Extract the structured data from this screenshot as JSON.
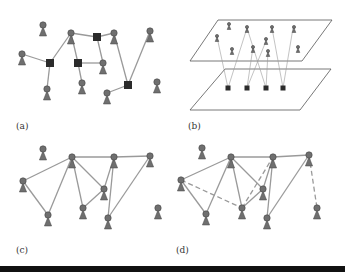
{
  "figure": {
    "colors": {
      "person_fill": "#6f6f6f",
      "person_stroke": "#444444",
      "square_fill": "#2b2b2b",
      "edge": "#9a9a9a",
      "plane": "#555555",
      "bar": "#111111"
    },
    "panels": [
      {
        "id": "a",
        "label": "(a)",
        "label_pos": [
          16,
          131
        ],
        "persons": [
          [
            43,
            25
          ],
          [
            71,
            33
          ],
          [
            114,
            33
          ],
          [
            150,
            31
          ],
          [
            22,
            54
          ],
          [
            103,
            63
          ],
          [
            47,
            89
          ],
          [
            82,
            83
          ],
          [
            107,
            93
          ],
          [
            157,
            82
          ]
        ],
        "squares": [
          [
            50,
            63
          ],
          [
            78,
            63
          ],
          [
            97,
            37
          ],
          [
            128,
            85
          ]
        ],
        "edges": [
          [
            [
              22,
              54
            ],
            [
              50,
              63
            ]
          ],
          [
            [
              50,
              63
            ],
            [
              47,
              89
            ]
          ],
          [
            [
              50,
              63
            ],
            [
              71,
              33
            ]
          ],
          [
            [
              71,
              33
            ],
            [
              97,
              37
            ]
          ],
          [
            [
              71,
              33
            ],
            [
              78,
              63
            ]
          ],
          [
            [
              78,
              63
            ],
            [
              103,
              63
            ]
          ],
          [
            [
              78,
              63
            ],
            [
              82,
              83
            ]
          ],
          [
            [
              97,
              37
            ],
            [
              114,
              33
            ]
          ],
          [
            [
              97,
              37
            ],
            [
              103,
              63
            ]
          ],
          [
            [
              114,
              33
            ],
            [
              128,
              85
            ]
          ],
          [
            [
              128,
              85
            ],
            [
              107,
              93
            ]
          ],
          [
            [
              128,
              85
            ],
            [
              150,
              31
            ]
          ]
        ],
        "dashed_edges": []
      },
      {
        "id": "b",
        "label": "(b)",
        "label_pos": [
          188,
          131
        ],
        "planes": [
          [
            [
              218,
              20
            ],
            [
              332,
              20
            ],
            [
              302,
              61
            ],
            [
              190,
              61
            ]
          ],
          [
            [
              225,
              69
            ],
            [
              331,
              69
            ],
            [
              300,
              110
            ],
            [
              190,
              110
            ]
          ]
        ],
        "small_persons": [
          [
            229,
            24
          ],
          [
            247,
            27
          ],
          [
            272,
            27
          ],
          [
            294,
            27
          ],
          [
            217,
            36
          ],
          [
            232,
            49
          ],
          [
            253,
            47
          ],
          [
            266,
            39
          ],
          [
            268,
            51
          ],
          [
            298,
            47
          ]
        ],
        "squares": [
          [
            228,
            88
          ],
          [
            247,
            88
          ],
          [
            266,
            88
          ],
          [
            283,
            88
          ]
        ],
        "edges": [
          [
            [
              228,
              88
            ],
            [
              217,
              37
            ]
          ],
          [
            [
              228,
              88
            ],
            [
              247,
              28
            ]
          ],
          [
            [
              247,
              88
            ],
            [
              253,
              47
            ]
          ],
          [
            [
              247,
              88
            ],
            [
              266,
              41
            ]
          ],
          [
            [
              266,
              88
            ],
            [
              247,
              28
            ]
          ],
          [
            [
              266,
              88
            ],
            [
              268,
              52
            ]
          ],
          [
            [
              283,
              88
            ],
            [
              272,
              28
            ]
          ],
          [
            [
              283,
              88
            ],
            [
              293,
              28
            ]
          ]
        ]
      },
      {
        "id": "c",
        "label": "(c)",
        "label_pos": [
          16,
          255
        ],
        "persons": [
          [
            43,
            149
          ],
          [
            72,
            157
          ],
          [
            114,
            157
          ],
          [
            150,
            156
          ],
          [
            23,
            181
          ],
          [
            104,
            189
          ],
          [
            48,
            215
          ],
          [
            83,
            208
          ],
          [
            108,
            218
          ],
          [
            158,
            208
          ]
        ],
        "squares": [],
        "edges": [
          [
            [
              72,
              157
            ],
            [
              23,
              181
            ]
          ],
          [
            [
              23,
              181
            ],
            [
              48,
              215
            ]
          ],
          [
            [
              48,
              215
            ],
            [
              72,
              157
            ]
          ],
          [
            [
              72,
              157
            ],
            [
              114,
              157
            ]
          ],
          [
            [
              114,
              157
            ],
            [
              150,
              156
            ]
          ],
          [
            [
              72,
              157
            ],
            [
              83,
              208
            ]
          ],
          [
            [
              72,
              157
            ],
            [
              104,
              189
            ]
          ],
          [
            [
              104,
              189
            ],
            [
              83,
              208
            ]
          ],
          [
            [
              104,
              189
            ],
            [
              114,
              157
            ]
          ],
          [
            [
              114,
              157
            ],
            [
              108,
              218
            ]
          ],
          [
            [
              150,
              156
            ],
            [
              108,
              218
            ]
          ]
        ],
        "dashed_edges": []
      },
      {
        "id": "d",
        "label": "(d)",
        "label_pos": [
          176,
          255
        ],
        "persons": [
          [
            202,
            148
          ],
          [
            231,
            157
          ],
          [
            273,
            157
          ],
          [
            309,
            155
          ],
          [
            181,
            180
          ],
          [
            263,
            189
          ],
          [
            206,
            214
          ],
          [
            242,
            208
          ],
          [
            267,
            218
          ],
          [
            317,
            208
          ]
        ],
        "squares": [],
        "edges": [
          [
            [
              231,
              157
            ],
            [
              181,
              180
            ]
          ],
          [
            [
              181,
              180
            ],
            [
              206,
              214
            ]
          ],
          [
            [
              206,
              214
            ],
            [
              231,
              157
            ]
          ],
          [
            [
              231,
              157
            ],
            [
              273,
              157
            ]
          ],
          [
            [
              273,
              157
            ],
            [
              309,
              155
            ]
          ],
          [
            [
              231,
              157
            ],
            [
              242,
              208
            ]
          ],
          [
            [
              231,
              157
            ],
            [
              263,
              189
            ]
          ],
          [
            [
              263,
              189
            ],
            [
              242,
              208
            ]
          ],
          [
            [
              263,
              189
            ],
            [
              273,
              157
            ]
          ],
          [
            [
              273,
              157
            ],
            [
              267,
              218
            ]
          ],
          [
            [
              309,
              155
            ],
            [
              267,
              218
            ]
          ]
        ],
        "dashed_edges": [
          [
            [
              181,
              180
            ],
            [
              242,
              208
            ]
          ],
          [
            [
              242,
              208
            ],
            [
              273,
              157
            ]
          ],
          [
            [
              309,
              155
            ],
            [
              317,
              208
            ]
          ]
        ]
      }
    ]
  }
}
